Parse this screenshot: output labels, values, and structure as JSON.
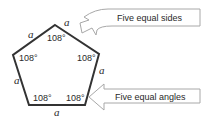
{
  "figure": {
    "shape": "regular-pentagon",
    "side_label": "a",
    "angle_label": "108°",
    "stroke_color": "#333333",
    "arrow_stroke_color": "#a8a8a8",
    "text_color": "#2a2a2a"
  },
  "sides": [
    {
      "label": "a",
      "position": "top-right"
    },
    {
      "label": "a",
      "position": "top-left"
    },
    {
      "label": "a",
      "position": "left"
    },
    {
      "label": "a",
      "position": "bottom"
    },
    {
      "label": "a",
      "position": "right"
    }
  ],
  "angles": [
    {
      "label": "108°",
      "vertex": "top"
    },
    {
      "label": "108°",
      "vertex": "upper-left"
    },
    {
      "label": "108°",
      "vertex": "upper-right"
    },
    {
      "label": "108°",
      "vertex": "lower-left"
    },
    {
      "label": "108°",
      "vertex": "lower-right"
    }
  ],
  "callouts": [
    {
      "label": "Five equal sides",
      "points_to": "top-right side"
    },
    {
      "label": "Five equal angles",
      "points_to": "lower-right angle"
    }
  ]
}
